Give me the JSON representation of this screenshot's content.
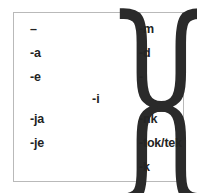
{
  "figure": {
    "name": "verb-affix-paradigm",
    "frame_border_color": "#b9b9b9",
    "text_color": "#232323",
    "background_color": "#ffffff"
  },
  "left_column": {
    "name": "left-affix-column",
    "items": [
      {
        "label": "–",
        "icon": "long-dash-zero-morph"
      },
      {
        "label": "-a",
        "icon": ""
      },
      {
        "label": "-e",
        "icon": ""
      },
      {
        "label": "-ja",
        "icon": ""
      },
      {
        "label": "-je",
        "icon": ""
      }
    ]
  },
  "right_column": {
    "name": "right-affix-column",
    "items": [
      {
        "label": "-m",
        "icon": ""
      },
      {
        "label": "-d",
        "icon": ""
      },
      {
        "label": "-",
        "icon": "short-dash-zero-morph"
      },
      {
        "label": "-nk",
        "icon": ""
      },
      {
        "label": "-tok/tek",
        "icon": ""
      },
      {
        "label": "-k",
        "icon": ""
      }
    ]
  },
  "center": {
    "label": "-i",
    "name": "infix-marker"
  },
  "braces": {
    "left_glyph": "}",
    "right_glyph": "{"
  }
}
